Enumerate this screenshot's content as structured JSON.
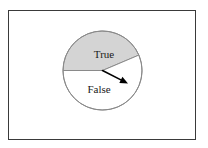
{
  "figure": {
    "frame_border_color": "#3a3a3a",
    "background_color": "#ffffff"
  },
  "chart_data": {
    "type": "pie",
    "title": "",
    "categories": [
      "True",
      "False"
    ],
    "values": [
      43.6,
      56.4
    ],
    "labels": [
      "True",
      "False"
    ],
    "colors": [
      "#ffffff",
      "#d4d4d4"
    ],
    "start_angle_deg": 180,
    "direction": "counterclockwise",
    "outline_color": "#8a8a8a",
    "legend": "none",
    "grid": false,
    "annotations": [
      {
        "type": "arrow",
        "name": "pointer-arrow",
        "from": [
          102.5,
          70.5
        ],
        "to": [
          128.0,
          83.5
        ],
        "color": "#000000"
      }
    ],
    "geometry": {
      "center": [
        102.5,
        70.5
      ],
      "radius": 39.5,
      "true_slice": {
        "start_deg": 180.0,
        "end_deg": 23.0,
        "label_pos": [
          104,
          55
        ]
      },
      "false_slice": {
        "start_deg": 23.0,
        "end_deg": 180.0,
        "label_pos": [
          99,
          90
        ]
      }
    }
  }
}
